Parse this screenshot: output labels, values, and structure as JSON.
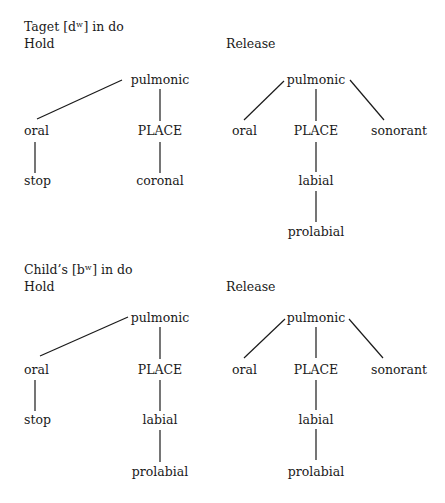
{
  "figure": {
    "sections": [
      {
        "title": "Taget [dʷ] in do",
        "hold": {
          "label": "Hold",
          "nodes": {
            "root": "pulmonic",
            "oral": "oral",
            "oral_child": "stop",
            "place": "PLACE",
            "place_child": "coronal"
          }
        },
        "release": {
          "label": "Release",
          "nodes": {
            "root": "pulmonic",
            "oral": "oral",
            "place": "PLACE",
            "sonorant": "sonorant",
            "place_child": "labial",
            "place_grandchild": "prolabial"
          }
        }
      },
      {
        "title": "Child’s [bʷ] in do",
        "hold": {
          "label": "Hold",
          "nodes": {
            "root": "pulmonic",
            "oral": "oral",
            "oral_child": "stop",
            "place": "PLACE",
            "place_child": "labial",
            "place_grandchild": "prolabial"
          }
        },
        "release": {
          "label": "Release",
          "nodes": {
            "root": "pulmonic",
            "oral": "oral",
            "place": "PLACE",
            "sonorant": "sonorant",
            "place_child": "labial",
            "place_grandchild": "prolabial"
          }
        }
      }
    ]
  }
}
